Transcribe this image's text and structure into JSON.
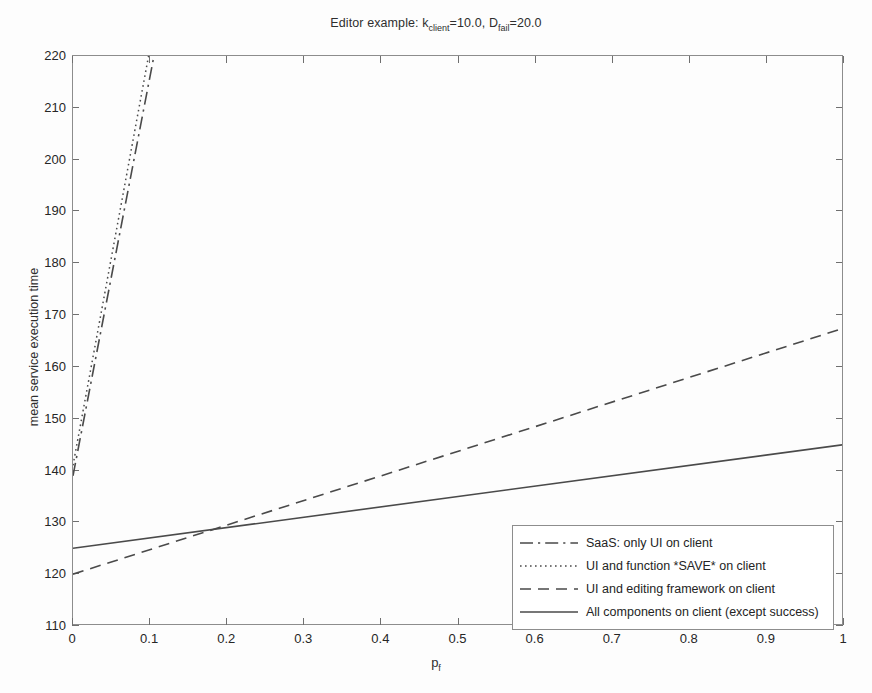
{
  "chart_data": {
    "type": "line",
    "title_parts": {
      "prefix": "Editor example: k",
      "sub1": "client",
      "mid": "=10.0, D",
      "sub2": "fail",
      "suffix": "=20.0"
    },
    "xlabel": "p_f",
    "xlabel_parts": {
      "base": "p",
      "sub": "f"
    },
    "ylabel": "mean service execution time",
    "xlim": [
      0,
      1
    ],
    "ylim": [
      110,
      220
    ],
    "xticks": [
      0,
      0.1,
      0.2,
      0.3,
      0.4,
      0.5,
      0.6,
      0.7,
      0.8,
      0.9,
      1
    ],
    "xticklabels": [
      "0",
      "0.1",
      "0.2",
      "0.3",
      "0.4",
      "0.5",
      "0.6",
      "0.7",
      "0.8",
      "0.9",
      "1"
    ],
    "yticks": [
      110,
      120,
      130,
      140,
      150,
      160,
      170,
      180,
      190,
      200,
      210,
      220
    ],
    "yticklabels": [
      "110",
      "120",
      "130",
      "140",
      "150",
      "160",
      "170",
      "180",
      "190",
      "200",
      "210",
      "220"
    ],
    "grid": false,
    "legend_position": "lower right",
    "line_color": "#4a4a4a",
    "axis_color": "#8d8d8d",
    "background_color": "#fdfdfd",
    "series": [
      {
        "name": "SaaS: only UI on client",
        "style": "dashdot",
        "x": [
          0,
          0.105
        ],
        "y": [
          139.0,
          220.0
        ],
        "note": "steep line leaving the top of the axes near p_f = 0.105"
      },
      {
        "name": "UI and function *SAVE* on client",
        "style": "dotted",
        "x": [
          0,
          0.098
        ],
        "y": [
          141.0,
          220.0
        ],
        "note": "steep line leaving the top of the axes near p_f = 0.098"
      },
      {
        "name": "UI and editing framework on client",
        "style": "dashed",
        "x": [
          0,
          1
        ],
        "y": [
          120.0,
          167.5
        ]
      },
      {
        "name": "All components on client (except success)",
        "style": "solid",
        "x": [
          0,
          1
        ],
        "y": [
          125.0,
          145.0
        ]
      }
    ]
  },
  "legend": {
    "entries": [
      "SaaS: only UI on client",
      "UI and function *SAVE* on client",
      "UI and editing framework on client",
      "All components on client (except success)"
    ]
  }
}
